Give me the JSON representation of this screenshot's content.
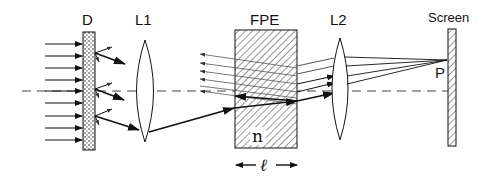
{
  "labels": {
    "diffuser": "D",
    "lens1": "L1",
    "etalon": "FPE",
    "lens2": "L2",
    "screen": "Screen",
    "point": "P",
    "refractive_index": "n",
    "thickness": "ℓ"
  },
  "colors": {
    "line": "#111111",
    "thin_ray": "#555555",
    "axis": "#444444",
    "background": "#ffffff"
  }
}
